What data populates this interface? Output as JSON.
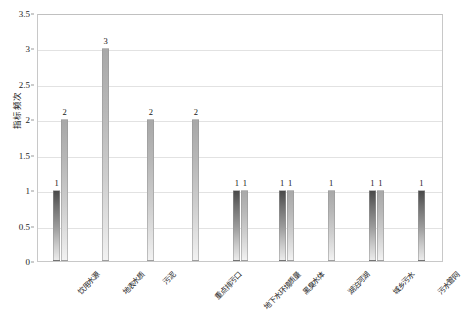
{
  "chart_data": {
    "type": "bar",
    "title": "",
    "subtitle": "",
    "xlabel": "",
    "ylabel": "指标频次",
    "ylim": [
      0,
      3.5
    ],
    "ytick_labels": [
      "0",
      "0.5",
      "1",
      "1.5",
      "2",
      "2.5",
      "3",
      "3.5"
    ],
    "ytick_values": [
      0,
      0.5,
      1,
      1.5,
      2,
      2.5,
      3,
      3.5
    ],
    "grid": true,
    "legend": "none",
    "categories": [
      "饮用水源",
      "地表水质",
      "污泥",
      "重点排污口",
      "地下水环境质量",
      "黑臭水体",
      "湖泊河湖",
      "城乡污水",
      "污水管网"
    ],
    "series": [
      {
        "name": "系列1",
        "color": "#5a5a5a",
        "values": [
          1,
          null,
          null,
          null,
          1,
          1,
          null,
          1,
          1
        ]
      },
      {
        "name": "系列2",
        "color": "#bdbdbd",
        "values": [
          2,
          3,
          2,
          2,
          1,
          1,
          1,
          1,
          null
        ]
      }
    ],
    "data_labels": [
      [
        "1",
        "2"
      ],
      [
        "3"
      ],
      [
        "2"
      ],
      [
        "2"
      ],
      [
        "1",
        "1"
      ],
      [
        "1",
        "1"
      ],
      [
        "1"
      ],
      [
        "1",
        "1"
      ],
      [
        "1"
      ]
    ]
  }
}
